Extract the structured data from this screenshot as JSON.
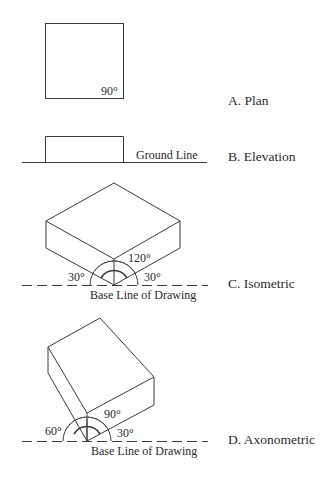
{
  "figures": [
    {
      "id": "A",
      "caption": "A.  Plan",
      "annotations": {
        "angle": "90°"
      }
    },
    {
      "id": "B",
      "caption": "B.  Elevation",
      "annotations": {
        "line_label": "Ground Line"
      }
    },
    {
      "id": "C",
      "caption": "C.  Isometric",
      "annotations": {
        "angle_top": "120°",
        "angle_left": "30°",
        "angle_right": "30°",
        "base_label": "Base Line of Drawing"
      }
    },
    {
      "id": "D",
      "caption": "D.  Axonometric",
      "annotations": {
        "angle_top": "90°",
        "angle_left": "60°",
        "angle_right": "30°",
        "base_label": "Base Line of Drawing"
      }
    }
  ],
  "colors": {
    "line": "#3a3a3a",
    "text": "#2a2a2a",
    "background": "#ffffff"
  }
}
